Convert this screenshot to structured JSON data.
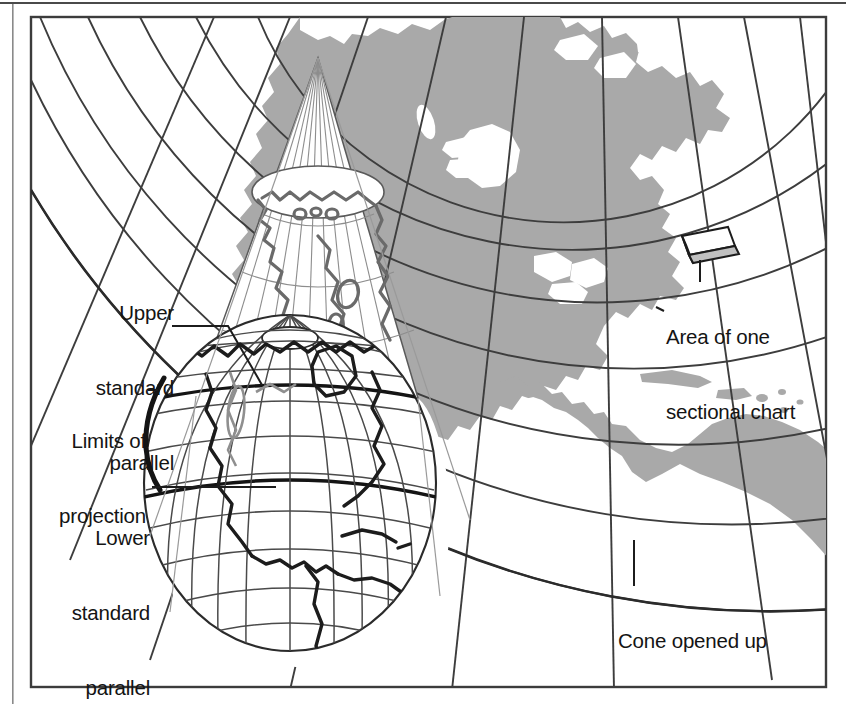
{
  "figure": {
    "frame_color": "#3c3c3c",
    "land_color": "#a9a9a9",
    "grid_color": "#3d3d3d",
    "coastline_color": "#1c1c1c",
    "background_color": "#ffffff"
  },
  "labels": {
    "upper_standard_parallel": {
      "line1": "Upper",
      "line2": "standard",
      "line3": "parallel"
    },
    "limits_of_projection": {
      "line1": "Limits of",
      "line2": "projection"
    },
    "lower_standard_parallel": {
      "line1": "Lower",
      "line2": "standard",
      "line3": "parallel"
    },
    "area_of_one_sectional_chart": {
      "line1": "Area of one",
      "line2": "sectional chart"
    },
    "cone_opened_up": {
      "line1": "Cone opened up"
    }
  },
  "callouts": [
    {
      "name": "upper-standard-parallel",
      "anchor": "globe-upper-parallel"
    },
    {
      "name": "limits-of-projection",
      "anchor": "globe-projection-limit-edge"
    },
    {
      "name": "lower-standard-parallel",
      "anchor": "globe-lower-parallel"
    },
    {
      "name": "area-of-one-sectional-chart",
      "anchor": "chart-area-box"
    },
    {
      "name": "cone-opened-up",
      "anchor": "flattened-cone-lower-arc"
    }
  ]
}
